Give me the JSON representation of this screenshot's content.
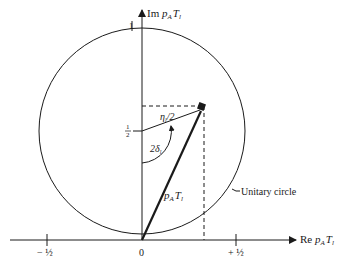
{
  "diagram": {
    "axes": {
      "y_label_prefix": "Im ",
      "y_label_var": "p",
      "y_label_sub": "A",
      "y_label_var2": "T",
      "y_label_sub2": "l",
      "x_label_prefix": "Re ",
      "x_label_var": "p",
      "x_label_sub": "A",
      "x_label_var2": "T",
      "x_label_sub2": "l"
    },
    "ticks": {
      "y_top": "1",
      "y_half_num": "1",
      "y_half_den": "2",
      "x_neg_half": "− ½",
      "x_origin": "0",
      "x_pos_half": "+ ½"
    },
    "labels": {
      "radius": "η",
      "radius_sub": "l",
      "radius_rest": "/2",
      "angle": "2δ",
      "angle_sub": "l",
      "vector_var": "p",
      "vector_sub": "A",
      "vector_var2": "T",
      "vector_sub2": "l",
      "circle_name": "Unitary circle"
    },
    "colors": {
      "ink": "#1a1a1a",
      "background": "#ffffff"
    }
  }
}
